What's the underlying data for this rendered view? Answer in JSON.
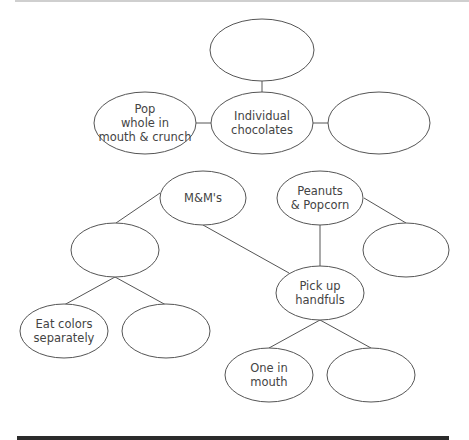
{
  "diagram": {
    "colors": {
      "stroke": "#555555",
      "text": "#444444",
      "bottom_bar": "#2b2b2b"
    },
    "nodes": [
      {
        "id": "top-blank",
        "label": "",
        "cx": 262,
        "cy": 50,
        "rx": 52,
        "ry": 31
      },
      {
        "id": "pop-whole",
        "label": "Pop\nwhole in\nmouth & crunch",
        "cx": 145,
        "cy": 123,
        "rx": 51,
        "ry": 31
      },
      {
        "id": "individual-chocolates",
        "label": "Individual\nchocolates",
        "cx": 262,
        "cy": 123,
        "rx": 51,
        "ry": 31
      },
      {
        "id": "right-blank",
        "label": "",
        "cx": 379,
        "cy": 123,
        "rx": 51,
        "ry": 31
      },
      {
        "id": "mms",
        "label": "M&M's",
        "cx": 203,
        "cy": 198,
        "rx": 43,
        "ry": 27
      },
      {
        "id": "peanuts-popcorn",
        "label": "Peanuts\n& Popcorn",
        "cx": 320,
        "cy": 198,
        "rx": 43,
        "ry": 27
      },
      {
        "id": "mms-child-blank",
        "label": "",
        "cx": 115,
        "cy": 250,
        "rx": 44,
        "ry": 27
      },
      {
        "id": "peanuts-child-blank",
        "label": "",
        "cx": 406,
        "cy": 250,
        "rx": 43,
        "ry": 27
      },
      {
        "id": "pick-up-handfuls",
        "label": "Pick up\nhandfuls",
        "cx": 320,
        "cy": 293,
        "rx": 44,
        "ry": 27
      },
      {
        "id": "eat-colors",
        "label": "Eat colors\nseparately",
        "cx": 64,
        "cy": 331,
        "rx": 44,
        "ry": 27
      },
      {
        "id": "eat-colors-sibling-blank",
        "label": "",
        "cx": 166,
        "cy": 331,
        "rx": 44,
        "ry": 27
      },
      {
        "id": "one-in-mouth",
        "label": "One in\nmouth",
        "cx": 269,
        "cy": 375,
        "rx": 44,
        "ry": 27
      },
      {
        "id": "one-in-mouth-sibling-blank",
        "label": "",
        "cx": 371,
        "cy": 375,
        "rx": 44,
        "ry": 27
      }
    ],
    "edges": [
      {
        "x1": 262,
        "y1": 81,
        "x2": 262,
        "y2": 92
      },
      {
        "x1": 195,
        "y1": 123,
        "x2": 211,
        "y2": 123
      },
      {
        "x1": 313,
        "y1": 123,
        "x2": 328,
        "y2": 123
      },
      {
        "x1": 160,
        "y1": 193,
        "x2": 116,
        "y2": 223
      },
      {
        "x1": 203,
        "y1": 225,
        "x2": 289,
        "y2": 273
      },
      {
        "x1": 320,
        "y1": 225,
        "x2": 320,
        "y2": 266
      },
      {
        "x1": 364,
        "y1": 198,
        "x2": 406,
        "y2": 223
      },
      {
        "x1": 115,
        "y1": 277,
        "x2": 64,
        "y2": 305
      },
      {
        "x1": 115,
        "y1": 277,
        "x2": 166,
        "y2": 305
      },
      {
        "x1": 320,
        "y1": 320,
        "x2": 269,
        "y2": 348
      },
      {
        "x1": 320,
        "y1": 320,
        "x2": 371,
        "y2": 348
      }
    ]
  }
}
